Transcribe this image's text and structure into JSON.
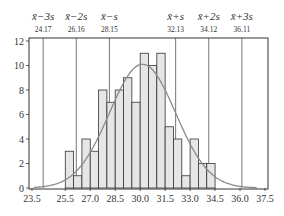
{
  "chart_data": {
    "type": "bar",
    "title": "",
    "xlabel": "",
    "ylabel": "",
    "xlim": [
      23.5,
      37.5
    ],
    "ylim": [
      0,
      12
    ],
    "x_ticks": [
      "23.5",
      "25.5",
      "27.0",
      "28.5",
      "30.0",
      "31.5",
      "33.0",
      "34.5",
      "36.0",
      "37.5"
    ],
    "x_tick_values": [
      23.5,
      25.5,
      27.0,
      28.5,
      30.0,
      31.5,
      33.0,
      34.5,
      36.0,
      37.5
    ],
    "y_ticks": [
      "0",
      "2",
      "4",
      "6",
      "8",
      "10",
      "12"
    ],
    "y_tick_values": [
      0,
      2,
      4,
      6,
      8,
      10,
      12
    ],
    "bin_width": 0.5,
    "bin_starts": [
      25.5,
      26.0,
      26.5,
      27.0,
      27.5,
      28.0,
      28.5,
      29.0,
      29.5,
      30.0,
      30.5,
      31.0,
      31.5,
      32.0,
      32.5,
      33.0,
      33.5,
      34.0
    ],
    "values": [
      3,
      1,
      4,
      3,
      8,
      7,
      8,
      9,
      7,
      11,
      10,
      11,
      5,
      4,
      1,
      4,
      2,
      2
    ],
    "bar_fill": "#e6e6e6",
    "bar_stroke": "#333333",
    "normal_curve": {
      "mean": 30.14,
      "sd": 1.99,
      "peak": 10.1,
      "color": "#8a8a8a",
      "x_range": [
        23.6,
        37.0
      ]
    },
    "reference_lines": [
      {
        "label": "x̄−3s",
        "value": 24.17,
        "value_label": "24.17"
      },
      {
        "label": "x̄−2s",
        "value": 26.16,
        "value_label": "26.16"
      },
      {
        "label": "x̄−s",
        "value": 28.15,
        "value_label": "28.15"
      },
      {
        "label": "x̄+s",
        "value": 32.13,
        "value_label": "32.13"
      },
      {
        "label": "x̄+2s",
        "value": 34.12,
        "value_label": "34.12"
      },
      {
        "label": "x̄+3s",
        "value": 36.11,
        "value_label": "36.11"
      }
    ],
    "grid": false,
    "legend": null
  }
}
